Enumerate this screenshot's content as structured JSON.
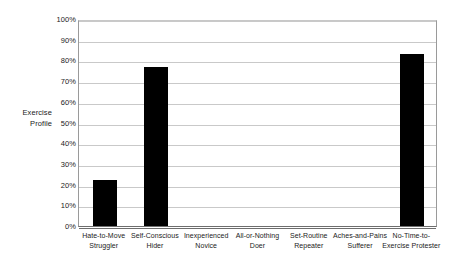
{
  "chart_data": {
    "type": "bar",
    "title": "",
    "xlabel": "",
    "ylabel": "Exercise Profile",
    "ylim": [
      0,
      100
    ],
    "grid": true,
    "legend": "none",
    "orientation": "vertical",
    "bar_color": "#000000",
    "gridline_color": "#c9c9c9",
    "axis_color": "#6e6e6e",
    "categories": [
      "Hate-to-Move Struggler",
      "Self-Conscious Hider",
      "Inexperienced Novice",
      "All-or-Nothing Doer",
      "Set-Routine Repeater",
      "Aches-and-Pains Sufferer",
      "No-Time-to-Exercise Protester"
    ],
    "category_lines": [
      [
        "Hate-to-Move",
        "Struggler"
      ],
      [
        "Self-Conscious",
        "Hider"
      ],
      [
        "Inexperienced",
        "Novice"
      ],
      [
        "All-or-Nothing",
        "Doer"
      ],
      [
        "Set-Routine",
        "Repeater"
      ],
      [
        "Aches-and-Pains",
        "Sufferer"
      ],
      [
        "No-Time-to-",
        "Exercise Protester"
      ]
    ],
    "values": [
      22,
      77,
      0,
      0,
      0,
      0,
      83
    ],
    "value_unit": "%",
    "y_ticks": [
      100,
      90,
      80,
      70,
      60,
      50,
      40,
      30,
      20,
      10,
      0
    ],
    "y_tick_labels": [
      "100%",
      "90%",
      "80%",
      "70%",
      "60%",
      "50%",
      "40%",
      "30%",
      "20%",
      "10%",
      "0%"
    ]
  },
  "axis": {
    "y_title_lines": [
      "Exercise",
      "Profile"
    ]
  }
}
